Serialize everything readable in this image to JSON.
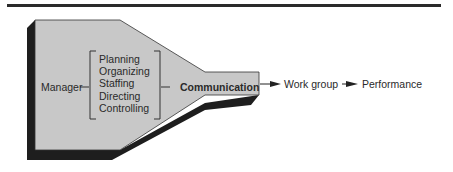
{
  "diagram": {
    "source": "Manager",
    "functions": [
      "Planning",
      "Organizing",
      "Staffing",
      "Directing",
      "Controlling"
    ],
    "channel": "Communication",
    "flow": [
      "Work group",
      "Performance"
    ]
  },
  "colors": {
    "shape_fill": "#c8c8c8",
    "shadow": "#1e1e1e",
    "rule": "#2a2a2a"
  }
}
